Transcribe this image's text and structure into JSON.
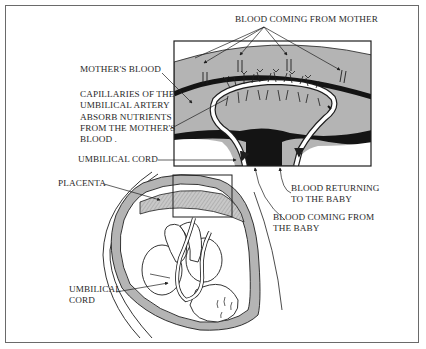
{
  "figure": {
    "labels": {
      "blood_from_mother": "BLOOD COMING FROM MOTHER",
      "mothers_blood": "MOTHER'S BLOOD",
      "capillaries": [
        "CAPILLARIES OF THE",
        "UMBILICAL ARTERY",
        "ABSORB NUTRIENTS",
        "FROM THE MOTHER'S",
        "BLOOD ."
      ],
      "umbilical_cord_top": "UMBILICAL CORD",
      "blood_returning": [
        "BLOOD RETURNING",
        "TO THE BABY"
      ],
      "blood_from_baby": [
        "BLOOD COMING FROM",
        "THE BABY"
      ],
      "placenta": "PLACENTA",
      "umbilical_cord_bottom": [
        "UMBILICAL",
        "CORD"
      ]
    },
    "colors": {
      "tissue_gray": "#b4b4b4",
      "dark_band": "#141414",
      "line": "#1e1e1e",
      "frame": "#6a6a6a"
    }
  }
}
